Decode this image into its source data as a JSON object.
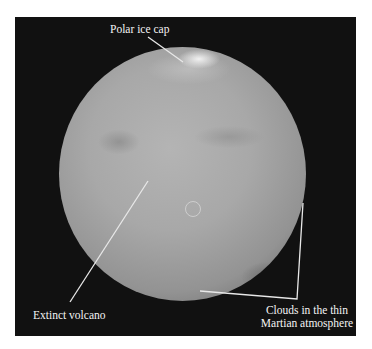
{
  "figure": {
    "labels": {
      "polar_ice_cap": "Polar ice cap",
      "extinct_volcano": "Extinct volcano",
      "clouds_line1": "Clouds in the thin",
      "clouds_line2": "Martian atmosphere"
    },
    "colors": {
      "background": "#111111",
      "label_text": "#f4f4f4",
      "leader_line": "#e8e8e8"
    }
  }
}
